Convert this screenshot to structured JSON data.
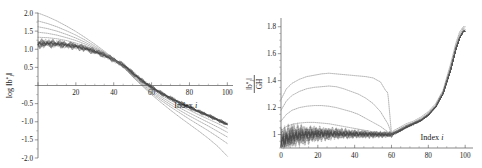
{
  "figure": {
    "background": "#ffffff",
    "ink": "#1a1a1a"
  },
  "chart_data": [
    {
      "panel": "left",
      "type": "line",
      "title": "",
      "xlabel": "Index i",
      "ylabel": "log ||b*_i||",
      "ylabel_parts": {
        "prefix": "log",
        "norm_open": "||",
        "b": "b",
        "star": "*",
        "sub": "i",
        "norm_close": "||"
      },
      "xlim": [
        0,
        103
      ],
      "ylim": [
        -2.0,
        2.0
      ],
      "grid": false,
      "legend": "none",
      "xticks": [
        0,
        20,
        40,
        60,
        80,
        100
      ],
      "xtick_labels": [
        "",
        "20",
        "40",
        "60",
        "80",
        "100"
      ],
      "yticks": [
        -2.0,
        -1.5,
        -1.0,
        -0.5,
        0.0,
        0.5,
        1.0,
        1.5,
        2.0
      ],
      "ytick_labels": [
        "-2.0",
        "-1.5",
        "-1.0",
        "-0.5",
        "",
        "0.5",
        "1.0",
        "1.5",
        "2.0"
      ],
      "xaxis_position_y": 0.0,
      "description": "Decreasing log Gram-Schmidt norm profiles; several outer curves fan from high start values down past a common crossing near index 48, plus a dense oscillating bundle of many curves starting near 1.15.",
      "series": [
        {
          "name": "curve-a",
          "color": "#6e6e6e",
          "x": [
            0,
            5,
            10,
            15,
            20,
            25,
            30,
            35,
            40,
            45,
            48,
            50,
            55,
            60,
            65,
            70,
            75,
            80,
            85,
            90,
            95,
            100
          ],
          "values": [
            2.0,
            1.9,
            1.78,
            1.64,
            1.49,
            1.32,
            1.14,
            0.95,
            0.74,
            0.5,
            0.35,
            0.24,
            -0.01,
            -0.25,
            -0.47,
            -0.68,
            -0.88,
            -1.07,
            -1.26,
            -1.46,
            -1.68,
            -1.95
          ]
        },
        {
          "name": "curve-b",
          "color": "#6e6e6e",
          "x": [
            0,
            5,
            10,
            15,
            20,
            25,
            30,
            35,
            40,
            45,
            48,
            50,
            55,
            60,
            65,
            70,
            75,
            80,
            85,
            90,
            95,
            100
          ],
          "values": [
            1.78,
            1.71,
            1.62,
            1.51,
            1.39,
            1.25,
            1.09,
            0.92,
            0.73,
            0.51,
            0.36,
            0.25,
            0.01,
            -0.21,
            -0.41,
            -0.59,
            -0.76,
            -0.93,
            -1.09,
            -1.25,
            -1.42,
            -1.6
          ]
        },
        {
          "name": "curve-c",
          "color": "#6e6e6e",
          "x": [
            0,
            5,
            10,
            15,
            20,
            25,
            30,
            35,
            40,
            45,
            48,
            50,
            55,
            60,
            65,
            70,
            75,
            80,
            85,
            90,
            95,
            100
          ],
          "values": [
            1.62,
            1.57,
            1.5,
            1.41,
            1.31,
            1.19,
            1.05,
            0.9,
            0.72,
            0.52,
            0.38,
            0.27,
            0.04,
            -0.17,
            -0.36,
            -0.53,
            -0.69,
            -0.84,
            -0.98,
            -1.12,
            -1.27,
            -1.42
          ]
        },
        {
          "name": "curve-d",
          "color": "#6e6e6e",
          "x": [
            0,
            5,
            10,
            15,
            20,
            25,
            30,
            35,
            40,
            45,
            48,
            50,
            55,
            60,
            65,
            70,
            75,
            80,
            85,
            90,
            95,
            100
          ],
          "values": [
            1.47,
            1.44,
            1.39,
            1.32,
            1.24,
            1.14,
            1.02,
            0.88,
            0.72,
            0.53,
            0.39,
            0.29,
            0.07,
            -0.13,
            -0.31,
            -0.47,
            -0.62,
            -0.76,
            -0.89,
            -1.02,
            -1.15,
            -1.29
          ]
        },
        {
          "name": "curve-e",
          "color": "#6e6e6e",
          "x": [
            0,
            5,
            10,
            15,
            20,
            25,
            30,
            35,
            40,
            45,
            48,
            50,
            55,
            60,
            65,
            70,
            75,
            80,
            85,
            90,
            95,
            100
          ],
          "values": [
            1.33,
            1.32,
            1.29,
            1.24,
            1.17,
            1.09,
            0.99,
            0.86,
            0.71,
            0.54,
            0.41,
            0.31,
            0.1,
            -0.09,
            -0.26,
            -0.41,
            -0.55,
            -0.68,
            -0.81,
            -0.93,
            -1.05,
            -1.18
          ]
        },
        {
          "name": "bundle-center",
          "color": "#3a3a3a",
          "x": [
            0,
            5,
            10,
            15,
            20,
            25,
            30,
            35,
            40,
            45,
            48,
            50,
            55,
            60,
            65,
            70,
            75,
            80,
            85,
            90,
            95,
            100
          ],
          "values": [
            1.15,
            1.16,
            1.15,
            1.12,
            1.08,
            1.02,
            0.94,
            0.84,
            0.71,
            0.56,
            0.44,
            0.34,
            0.13,
            -0.05,
            -0.21,
            -0.35,
            -0.48,
            -0.6,
            -0.72,
            -0.83,
            -0.95,
            -1.07
          ]
        }
      ],
      "bundle": {
        "name": "dense-oscillating-bundle",
        "count": 60,
        "start_value": 1.15,
        "spread_start": 0.16,
        "spread_end": 0.05,
        "color": "#4a4a4a"
      }
    },
    {
      "panel": "right",
      "type": "line",
      "title": "",
      "xlabel": "Index i",
      "ylabel": "||b*_i|| / GH",
      "ylabel_parts": {
        "numerator": "||b*_i||",
        "denominator": "GH"
      },
      "xlim": [
        0,
        101
      ],
      "ylim": [
        0.9,
        1.85
      ],
      "grid": false,
      "legend": "none",
      "xticks": [
        0,
        20,
        40,
        60,
        80,
        100
      ],
      "xtick_labels": [
        "0",
        "20",
        "40",
        "60",
        "80",
        "100"
      ],
      "yticks": [
        1.0,
        1.2,
        1.4,
        1.6,
        1.8
      ],
      "ytick_labels": [
        "1",
        "1.2",
        "1.4",
        "1.6",
        "1.8"
      ],
      "description": "Ratio of Gram-Schmidt norm to Gaussian-Heuristic; outer curves bulge to peaks near 1.45 around index 25-45, all converge near 1.0 at index 60, then rise sharply to 1.8 past index 90. A dense oscillating bundle hugs 1.0 over indices 0-60.",
      "series": [
        {
          "name": "ratio-curve-a",
          "color": "#6e6e6e",
          "x": [
            0,
            3,
            6,
            10,
            14,
            18,
            22,
            26,
            30,
            34,
            38,
            42,
            46,
            50,
            54,
            58,
            60,
            64,
            68,
            72,
            76,
            80,
            84,
            88,
            92,
            95,
            97,
            99,
            100
          ],
          "values": [
            1.26,
            1.34,
            1.38,
            1.41,
            1.43,
            1.44,
            1.45,
            1.455,
            1.45,
            1.445,
            1.44,
            1.435,
            1.43,
            1.42,
            1.39,
            1.3,
            1.02,
            1.05,
            1.08,
            1.1,
            1.13,
            1.17,
            1.23,
            1.33,
            1.52,
            1.68,
            1.76,
            1.8,
            1.8
          ]
        },
        {
          "name": "ratio-curve-b",
          "color": "#6e6e6e",
          "x": [
            0,
            3,
            6,
            10,
            14,
            18,
            22,
            26,
            30,
            34,
            38,
            42,
            46,
            50,
            54,
            58,
            60,
            64,
            68,
            72,
            76,
            80,
            84,
            88,
            92,
            95,
            97,
            99,
            100
          ],
          "values": [
            1.18,
            1.25,
            1.29,
            1.32,
            1.34,
            1.35,
            1.355,
            1.36,
            1.355,
            1.34,
            1.32,
            1.3,
            1.27,
            1.23,
            1.17,
            1.08,
            1.01,
            1.04,
            1.07,
            1.09,
            1.12,
            1.16,
            1.22,
            1.32,
            1.5,
            1.66,
            1.74,
            1.79,
            1.79
          ]
        },
        {
          "name": "ratio-curve-c",
          "color": "#6e6e6e",
          "x": [
            0,
            3,
            6,
            10,
            14,
            18,
            22,
            26,
            30,
            34,
            38,
            42,
            46,
            50,
            54,
            58,
            60,
            64,
            68,
            72,
            76,
            80,
            84,
            88,
            92,
            95,
            97,
            99,
            100
          ],
          "values": [
            1.1,
            1.15,
            1.18,
            1.2,
            1.21,
            1.215,
            1.215,
            1.21,
            1.2,
            1.185,
            1.17,
            1.15,
            1.12,
            1.09,
            1.06,
            1.02,
            1.005,
            1.035,
            1.065,
            1.09,
            1.115,
            1.155,
            1.215,
            1.315,
            1.49,
            1.65,
            1.73,
            1.78,
            1.78
          ]
        },
        {
          "name": "ratio-curve-d",
          "color": "#6e6e6e",
          "x": [
            0,
            3,
            6,
            10,
            14,
            18,
            22,
            26,
            30,
            34,
            38,
            42,
            46,
            50,
            54,
            58,
            60,
            64,
            68,
            72,
            76,
            80,
            84,
            88,
            92,
            95,
            97,
            99,
            100
          ],
          "values": [
            1.03,
            1.06,
            1.075,
            1.085,
            1.09,
            1.09,
            1.085,
            1.08,
            1.07,
            1.06,
            1.05,
            1.04,
            1.03,
            1.02,
            1.012,
            1.005,
            1.0,
            1.03,
            1.06,
            1.085,
            1.11,
            1.15,
            1.21,
            1.31,
            1.48,
            1.64,
            1.72,
            1.77,
            1.77
          ]
        },
        {
          "name": "ratio-bundle-center",
          "color": "#3a3a3a",
          "x": [
            0,
            3,
            6,
            10,
            14,
            18,
            22,
            26,
            30,
            34,
            38,
            42,
            46,
            50,
            54,
            58,
            60,
            64,
            68,
            72,
            76,
            80,
            84,
            88,
            92,
            95,
            97,
            99,
            100
          ],
          "values": [
            0.95,
            0.97,
            0.985,
            0.995,
            1.0,
            1.003,
            1.005,
            1.006,
            1.006,
            1.005,
            1.004,
            1.003,
            1.002,
            1.001,
            1.0,
            1.0,
            1.0,
            1.025,
            1.055,
            1.08,
            1.105,
            1.145,
            1.205,
            1.305,
            1.475,
            1.635,
            1.715,
            1.765,
            1.765
          ]
        }
      ],
      "bundle": {
        "name": "dense-oscillating-bundle",
        "count": 72,
        "center": 1.0,
        "spread_start": 0.13,
        "spread_end": 0.015,
        "color": "#4a4a4a"
      }
    }
  ]
}
